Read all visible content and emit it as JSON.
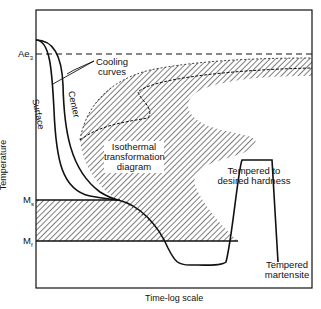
{
  "diagram": {
    "type": "heat-treatment-TTT-diagram",
    "axes": {
      "x_label": "Time-log scale",
      "y_label": "Temperature"
    },
    "levels": {
      "ae3": "Ae",
      "ae3_sub": "3",
      "ms": "M",
      "ms_sub": "s",
      "mf": "M",
      "mf_sub": "f"
    },
    "annotations": {
      "cooling_curves_1": "Cooling",
      "cooling_curves_2": "curves",
      "surface": "Surface",
      "center": "Center",
      "isothermal_1": "Isothermal",
      "isothermal_2": "transformation",
      "isothermal_3": "diagram",
      "tempered_hardness_1": "Tempered to",
      "tempered_hardness_2": "desired hardness",
      "tempered_martensite_1": "Tempered",
      "tempered_martensite_2": "martensite"
    },
    "colors": {
      "line": "#111111",
      "background": "#ffffff"
    }
  }
}
